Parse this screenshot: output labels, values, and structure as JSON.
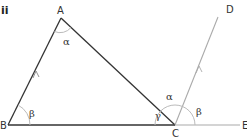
{
  "part_label": "ii",
  "points": {
    "A": {
      "label": "A",
      "x": 61,
      "y": 18
    },
    "B": {
      "label": "B",
      "x": 8,
      "y": 125
    },
    "C": {
      "label": "C",
      "x": 175,
      "y": 125
    },
    "D": {
      "label": "D",
      "x": 218,
      "y": 15
    },
    "E": {
      "label": "E",
      "x": 240,
      "y": 125
    }
  },
  "angles": {
    "A_alpha": "α",
    "B_beta": "β",
    "C_gamma": "γ",
    "C_alpha": "α",
    "C_beta": "β"
  },
  "colors": {
    "triangle_stroke": "#333333",
    "extension_stroke": "#999999",
    "arc_stroke": "#bbbbbb"
  },
  "notes": {
    "parallel_sides": [
      "AB",
      "CD"
    ]
  }
}
